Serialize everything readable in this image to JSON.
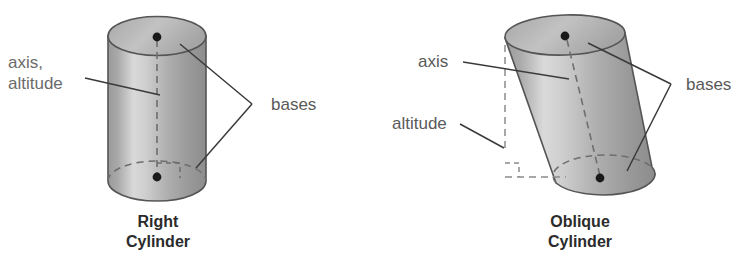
{
  "figure": {
    "background_color": "#ffffff",
    "body_fill_light": "#e2e2e2",
    "body_fill_mid": "#b5b5b5",
    "body_fill_dark": "#8e8e8e",
    "top_face_fill": "#b9b9b9",
    "outline_color": "#555555",
    "dash_color": "#6e6e6e",
    "leader_color": "#3a3a3a",
    "label_color": "#6b6b6b",
    "caption_color": "#2b2b2b",
    "dot_color": "#1a1a1a"
  },
  "right_cylinder": {
    "labels": {
      "axis_altitude_line1": "axis,",
      "axis_altitude_line2": "altitude",
      "bases": "bases"
    },
    "caption_line1": "Right",
    "caption_line2": "Cylinder",
    "icon_names": {
      "axis_dash": "dashed-axis-line",
      "right_angle": "right-angle-marker",
      "top_center_dot": "base-center-dot",
      "bottom_center_dot": "base-center-dot"
    }
  },
  "oblique_cylinder": {
    "labels": {
      "axis": "axis",
      "altitude": "altitude",
      "bases": "bases"
    },
    "caption_line1": "Oblique",
    "caption_line2": "Cylinder",
    "icon_names": {
      "axis_dash": "dashed-axis-line",
      "altitude_dash": "dashed-altitude-line",
      "right_angle": "right-angle-marker",
      "top_center_dot": "base-center-dot",
      "bottom_center_dot": "base-center-dot"
    }
  }
}
